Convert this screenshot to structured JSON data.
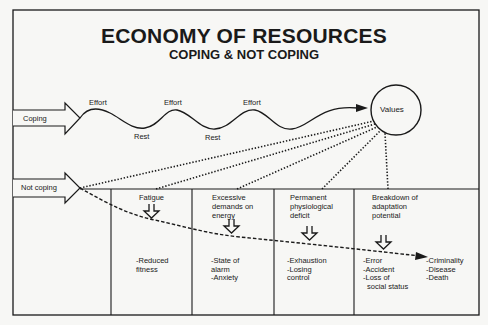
{
  "title": "ECONOMY OF RESOURCES",
  "subtitle": "COPING & NOT COPING",
  "coping": {
    "label": "Coping",
    "wave_labels": {
      "effort_1": "Effort",
      "effort_2": "Effort",
      "effort_3": "Effort",
      "rest_1": "Rest",
      "rest_2": "Rest"
    },
    "target": "Values"
  },
  "not_coping": {
    "label": "Not coping",
    "stages": [
      {
        "heading": [
          "Fatigue"
        ],
        "outcomes": [
          "-Reduced",
          "fitness"
        ]
      },
      {
        "heading": [
          "Excessive",
          "demands on",
          "energy"
        ],
        "outcomes": [
          "-State of",
          "alarm",
          "-Anxiety"
        ]
      },
      {
        "heading": [
          "Permanent",
          "physiological",
          "deficit"
        ],
        "outcomes": [
          "-Exhaustion",
          "-Losing",
          "control"
        ]
      },
      {
        "heading": [
          "Breakdown of",
          "adaptation",
          "potential"
        ],
        "outcomes": [
          "-Error",
          "-Accident",
          "-Loss of",
          "social status"
        ]
      }
    ],
    "final_outcomes": [
      "-Criminality",
      "-Disease",
      "-Death"
    ]
  },
  "colors": {
    "ink": "#1a1a1a",
    "background": "#f7f7f5"
  }
}
